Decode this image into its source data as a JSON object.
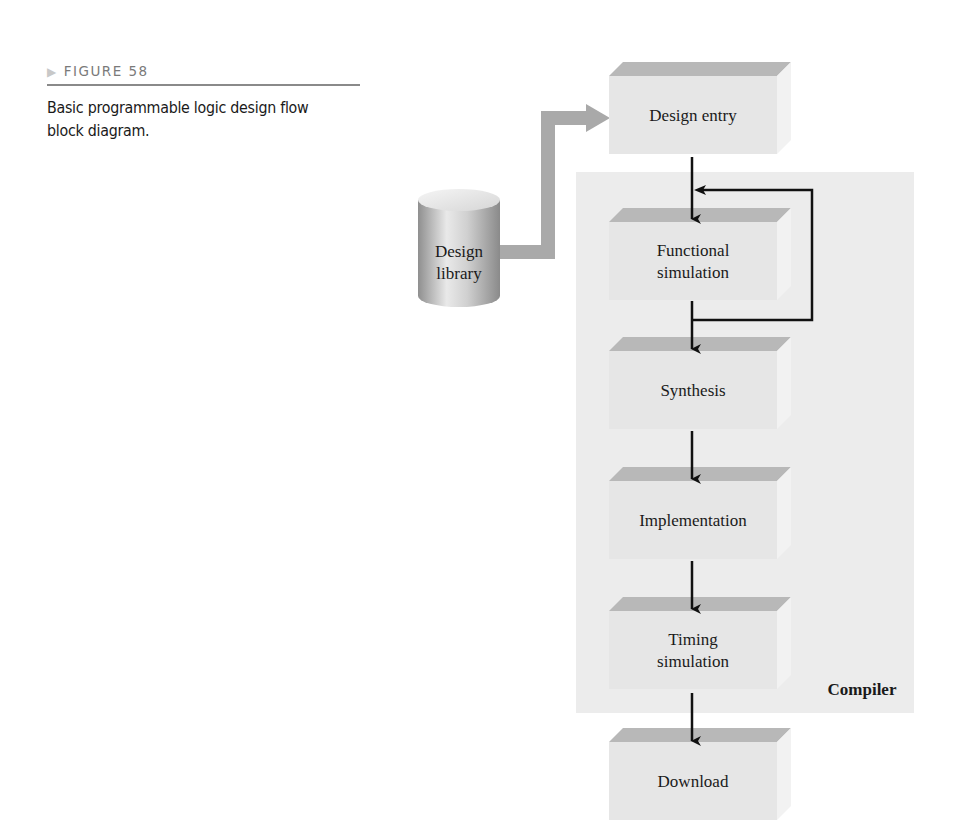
{
  "figure": {
    "label": "FIGURE 58",
    "caption": "Basic programmable logic design flow block diagram."
  },
  "diagram": {
    "library": {
      "line1": "Design",
      "line2": "library"
    },
    "compiler_label": "Compiler",
    "blocks": [
      {
        "id": "design-entry",
        "lines": [
          "Design entry"
        ]
      },
      {
        "id": "functional-simulation",
        "lines": [
          "Functional",
          "simulation"
        ]
      },
      {
        "id": "synthesis",
        "lines": [
          "Synthesis"
        ]
      },
      {
        "id": "implementation",
        "lines": [
          "Implementation"
        ]
      },
      {
        "id": "timing-simulation",
        "lines": [
          "Timing",
          "simulation"
        ]
      },
      {
        "id": "download",
        "lines": [
          "Download"
        ]
      }
    ],
    "colors": {
      "compiler_panel": "#ececec",
      "block_front": "#e6e6e6",
      "block_top": "#b8b8b8",
      "block_side": "#f2f2f2",
      "flow_arrow": "#111111",
      "library_arrow": "#a9a9a9"
    }
  }
}
